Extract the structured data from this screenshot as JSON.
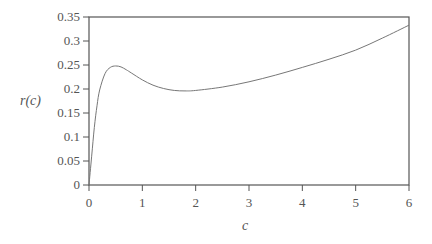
{
  "chart_data": {
    "type": "line",
    "title": "",
    "xlabel": "c",
    "ylabel": "r(c)",
    "xlim": [
      0,
      6
    ],
    "ylim": [
      0,
      0.35
    ],
    "grid": false,
    "legend": null,
    "x_ticks": [
      "0",
      "1",
      "2",
      "3",
      "4",
      "5",
      "6"
    ],
    "y_ticks": [
      "0",
      "0.05",
      "0.1",
      "0.15",
      "0.2",
      "0.25",
      "0.3",
      "0.35"
    ],
    "series": [
      {
        "name": "r(c)",
        "color": "#777777",
        "x": [
          0,
          0.05,
          0.1,
          0.15,
          0.2,
          0.3,
          0.4,
          0.5,
          0.6,
          0.7,
          0.8,
          1.0,
          1.2,
          1.4,
          1.6,
          1.8,
          2.0,
          2.5,
          3.0,
          3.5,
          4.0,
          4.5,
          5.0,
          5.5,
          6.0
        ],
        "values": [
          0,
          0.06,
          0.12,
          0.165,
          0.198,
          0.232,
          0.245,
          0.248,
          0.246,
          0.24,
          0.233,
          0.219,
          0.208,
          0.201,
          0.197,
          0.196,
          0.197,
          0.204,
          0.215,
          0.229,
          0.245,
          0.262,
          0.281,
          0.306,
          0.333
        ]
      }
    ]
  }
}
